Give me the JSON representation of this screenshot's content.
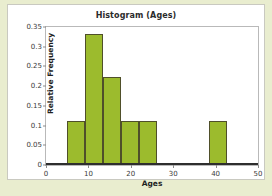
{
  "chart_data": {
    "type": "bar",
    "title": "Histogram (Ages)",
    "xlabel": "Ages",
    "ylabel": "Relative Frequency",
    "xlim": [
      0,
      50
    ],
    "ylim": [
      0,
      0.35
    ],
    "grid": false,
    "legend": null,
    "bar_color": "#9cbb2d",
    "bar_edge_color": "#4f4f2a",
    "xticks": [
      0,
      10,
      20,
      30,
      40,
      50
    ],
    "xtick_labels": [
      "0",
      "10",
      "20",
      "30",
      "40",
      "50"
    ],
    "yticks": [
      0,
      0.05,
      0.1,
      0.15,
      0.2,
      0.25,
      0.3,
      0.35
    ],
    "ytick_labels": [
      "0",
      "0.05",
      "0.1",
      "0.15",
      "0.2",
      "0.25",
      "0.3",
      "0.35"
    ],
    "bins": [
      {
        "label": "5-9.25",
        "left": 5,
        "right": 9.25,
        "value": 0.111
      },
      {
        "label": "9.25-13.5",
        "left": 9.25,
        "right": 13.5,
        "value": 0.333
      },
      {
        "label": "13.5-17.75",
        "left": 13.5,
        "right": 17.75,
        "value": 0.222
      },
      {
        "label": "17.75-22",
        "left": 17.75,
        "right": 22,
        "value": 0.111
      },
      {
        "label": "22-26.25",
        "left": 22,
        "right": 26.25,
        "value": 0.111
      },
      {
        "label": "38.5-42.75",
        "left": 38.5,
        "right": 42.75,
        "value": 0.111
      }
    ],
    "categories": [
      "5-9.25",
      "9.25-13.5",
      "13.5-17.75",
      "17.75-22",
      "22-26.25",
      "38.5-42.75"
    ],
    "values": [
      0.111,
      0.333,
      0.222,
      0.111,
      0.111,
      0.111
    ]
  }
}
